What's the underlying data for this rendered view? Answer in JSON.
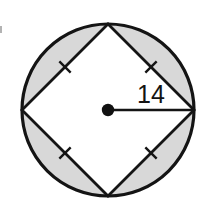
{
  "figure": {
    "background_color": "#ffffff",
    "stroke_color": "#141414",
    "shaded_region_color": "#d8d8d8",
    "center_dot_color": "#111111",
    "radius_label": "14",
    "tick_mark_count": 4,
    "shaded_segment_count": 4
  },
  "geometry": {
    "circle": {
      "center_x": 108,
      "center_y": 110,
      "radius": 86,
      "stroke_width": 3.2
    },
    "square": {
      "orientation": "diamond",
      "stroke_width": 2.8,
      "vertices": [
        {
          "name": "top",
          "x": 108,
          "y": 24
        },
        {
          "name": "right",
          "x": 194,
          "y": 110
        },
        {
          "name": "bottom",
          "x": 108,
          "y": 196
        },
        {
          "name": "left",
          "x": 22,
          "y": 110
        }
      ]
    },
    "center_dot": {
      "x": 108,
      "y": 110,
      "radius": 6.2
    },
    "radius_line": {
      "x1": 108,
      "y1": 110,
      "x2": 194,
      "y2": 110,
      "stroke_width": 2.6
    },
    "label_position": {
      "x": 137,
      "y": 103
    },
    "tick_marks": [
      {
        "name": "upper-left-side",
        "cx": 65,
        "cy": 67,
        "angle": -45
      },
      {
        "name": "upper-right-side",
        "cx": 151,
        "cy": 67,
        "angle": 45
      },
      {
        "name": "lower-left-side",
        "cx": 65,
        "cy": 153,
        "angle": 45
      },
      {
        "name": "lower-right-side",
        "cx": 151,
        "cy": 153,
        "angle": -45
      }
    ],
    "shaded_segments": [
      {
        "name": "top-segment",
        "from": "left",
        "to": "top"
      },
      {
        "name": "right-segment",
        "from": "top",
        "to": "right"
      },
      {
        "name": "bottom-segment",
        "from": "right",
        "to": "bottom"
      },
      {
        "name": "left-segment",
        "from": "bottom",
        "to": "left"
      }
    ]
  }
}
